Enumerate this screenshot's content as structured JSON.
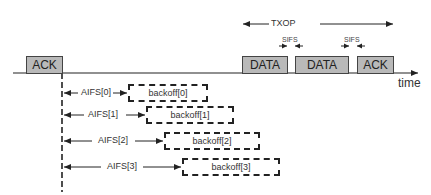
{
  "diagram": {
    "title_arrow": {
      "label": "TXOP"
    },
    "timeline": {
      "axis_label": "time"
    },
    "frames": [
      {
        "label": "ACK"
      },
      {
        "label": "DATA"
      },
      {
        "label": "DATA"
      },
      {
        "label": "ACK"
      }
    ],
    "sifs": [
      {
        "label": "SIFS"
      },
      {
        "label": "SIFS"
      }
    ],
    "rows": [
      {
        "aifs": "AIFS[0]",
        "backoff": "backoff[0]"
      },
      {
        "aifs": "AIFS[1]",
        "backoff": "backoff[1]"
      },
      {
        "aifs": "AIFS[2]",
        "backoff": "backoff[2]"
      },
      {
        "aifs": "AIFS[3]",
        "backoff": "backoff[3]"
      }
    ],
    "colors": {
      "frame_fill": "#b9b9b9",
      "line": "#222222"
    }
  }
}
